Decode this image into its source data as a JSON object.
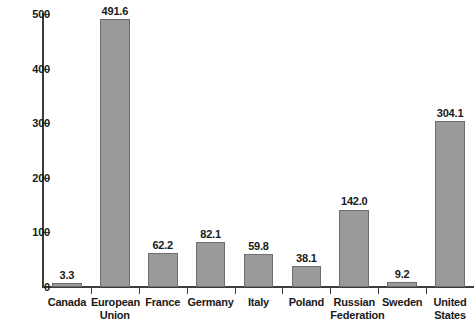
{
  "chart_data": {
    "type": "bar",
    "title": "",
    "subtitle": "",
    "xlabel": "",
    "ylabel": "",
    "ylim": [
      0,
      500
    ],
    "ytick_labels": [
      "0",
      "100",
      "200",
      "300",
      "400",
      "500"
    ],
    "ytick_values": [
      0,
      100,
      200,
      300,
      400,
      500
    ],
    "grid": false,
    "legend": false,
    "categories": [
      "Canada",
      "European Union",
      "France",
      "Germany",
      "Italy",
      "Poland",
      "Russian Federation",
      "Sweden",
      "United States"
    ],
    "category_lines": [
      [
        "Canada"
      ],
      [
        "European",
        "Union"
      ],
      [
        "France"
      ],
      [
        "Germany"
      ],
      [
        "Italy"
      ],
      [
        "Poland"
      ],
      [
        "Russian",
        "Federation"
      ],
      [
        "Sweden"
      ],
      [
        "United",
        "States"
      ]
    ],
    "values": [
      3.3,
      491.6,
      62.2,
      82.1,
      59.8,
      38.1,
      142.0,
      9.2,
      304.1
    ],
    "value_labels": [
      "3.3",
      "491.6",
      "62.2",
      "82.1",
      "59.8",
      "38.1",
      "142.0",
      "9.2",
      "304.1"
    ]
  },
  "style": {
    "bar_fill": "#9a9a9a",
    "bar_stroke": "#6e6e6e",
    "axis_color": "#3c3c3c",
    "text_color": "#1a1a1a",
    "background": "#ffffff"
  }
}
